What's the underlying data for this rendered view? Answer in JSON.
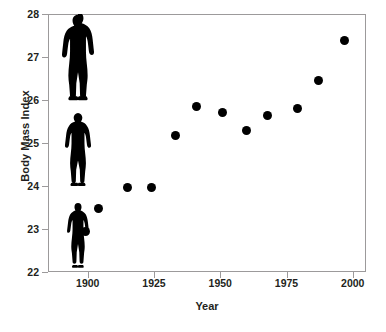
{
  "chart_data": {
    "type": "scatter",
    "title": "",
    "xlabel": "Year",
    "ylabel": "Body Mass Index",
    "xlim": [
      1885,
      2005
    ],
    "ylim": [
      22,
      28
    ],
    "grid": false,
    "legend": "none",
    "marker_color": "#000000",
    "x": [
      1899,
      1904,
      1915,
      1924,
      1933,
      1941,
      1951,
      1960,
      1968,
      1979,
      1987,
      1997
    ],
    "values": [
      22.95,
      23.47,
      23.97,
      23.96,
      25.18,
      25.85,
      25.72,
      25.3,
      25.63,
      25.8,
      26.46,
      27.39
    ],
    "points": [
      {
        "x": 1899,
        "y": 22.95
      },
      {
        "x": 1904,
        "y": 23.47
      },
      {
        "x": 1915,
        "y": 23.97
      },
      {
        "x": 1924,
        "y": 23.96
      },
      {
        "x": 1933,
        "y": 25.18
      },
      {
        "x": 1941,
        "y": 25.85
      },
      {
        "x": 1951,
        "y": 25.72
      },
      {
        "x": 1960,
        "y": 25.3
      },
      {
        "x": 1968,
        "y": 25.63
      },
      {
        "x": 1979,
        "y": 25.8
      },
      {
        "x": 1987,
        "y": 26.46
      },
      {
        "x": 1997,
        "y": 27.39
      }
    ],
    "xticks": [
      1900,
      1925,
      1950,
      1975,
      2000
    ],
    "xtick_labels": [
      "1900",
      "1925",
      "1950",
      "1975",
      "2000"
    ],
    "yticks": [
      22,
      23,
      24,
      25,
      26,
      27,
      28
    ],
    "ytick_labels": [
      "22",
      "23",
      "24",
      "25",
      "26",
      "27",
      "28"
    ],
    "annotations": [
      {
        "name": "human-silhouette-large",
        "icon": "person-silhouette-icon",
        "bmi_level": 27.4,
        "scale": "large"
      },
      {
        "name": "human-silhouette-medium",
        "icon": "person-silhouette-icon",
        "bmi_level": 25.4,
        "scale": "medium"
      },
      {
        "name": "human-silhouette-small",
        "icon": "person-silhouette-icon",
        "bmi_level": 23.4,
        "scale": "small"
      }
    ]
  }
}
